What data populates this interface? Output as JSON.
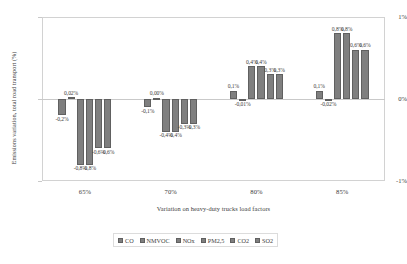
{
  "chart_data": {
    "type": "bar",
    "title": "",
    "subtitle": "",
    "xlabel": "Variation on heavy-duty trucks load factors",
    "ylabel": "Emissions variation, total road transport (%)",
    "categories": [
      "65%",
      "70%",
      "80%",
      "85%"
    ],
    "ylim": [
      -1,
      1
    ],
    "ytick_labels": [
      "1%",
      "0%",
      "-1%"
    ],
    "ytick_values": [
      1,
      0,
      -1
    ],
    "grid": false,
    "legend_position": "bottom",
    "value_labels_shown": true,
    "decimal_separator": ",",
    "series": [
      {
        "name": "CO",
        "color": "#7f7f7f",
        "values": [
          -0.2,
          -0.1,
          0.1,
          0.1
        ],
        "labels": [
          "-0,2%",
          "-0,1%",
          "0,1%",
          "0,1%"
        ]
      },
      {
        "name": "NMVOC",
        "color": "#7f7f7f",
        "values": [
          0.02,
          0.0,
          -0.01,
          -0.02
        ],
        "labels": [
          "0,02%",
          "0,00%",
          "-0,01%",
          "-0,02%"
        ]
      },
      {
        "name": "NOx",
        "color": "#7f7f7f",
        "values": [
          -0.8,
          -0.4,
          0.4,
          0.8
        ],
        "labels": [
          "-0,8%",
          "-0,4%",
          "0,4%",
          "0,8%"
        ]
      },
      {
        "name": "PM2,5",
        "color": "#7f7f7f",
        "values": [
          -0.8,
          -0.4,
          0.4,
          0.8
        ],
        "labels": [
          "-0,8%",
          "-0,4%",
          "0,4%",
          "0,8%"
        ]
      },
      {
        "name": "CO2",
        "color": "#7f7f7f",
        "values": [
          -0.6,
          -0.3,
          0.3,
          0.6
        ],
        "labels": [
          "-0,6%",
          "-0,3%",
          "0,3%",
          "0,6%"
        ]
      },
      {
        "name": "SO2",
        "color": "#7f7f7f",
        "values": [
          -0.6,
          -0.3,
          0.3,
          0.6
        ],
        "labels": [
          "-0,6%",
          "-0,3%",
          "0,3%",
          "0,6%"
        ]
      }
    ]
  }
}
